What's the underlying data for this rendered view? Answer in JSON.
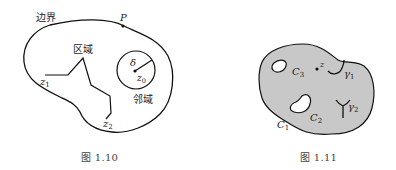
{
  "figures": [
    {
      "id": "fig-1-10",
      "caption": "图 1.10",
      "labels": {
        "boundary": "边界",
        "point_p": "P",
        "region": "区域",
        "delta": "δ",
        "z0_base": "z",
        "z0_sub": "0",
        "neighborhood": "邻域",
        "z1_base": "z",
        "z1_sub": "1",
        "z2_base": "z",
        "z2_sub": "2"
      }
    },
    {
      "id": "fig-1-11",
      "caption": "图 1.11",
      "fill_color": "#c8c8c8",
      "labels": {
        "c1_base": "C",
        "c1_sub": "1",
        "c2_base": "C",
        "c2_sub": "2",
        "c3_base": "C",
        "c3_sub": "3",
        "z": "z",
        "gamma1_base": "γ",
        "gamma1_sub": "1",
        "gamma2_base": "γ",
        "gamma2_sub": "2"
      }
    }
  ]
}
